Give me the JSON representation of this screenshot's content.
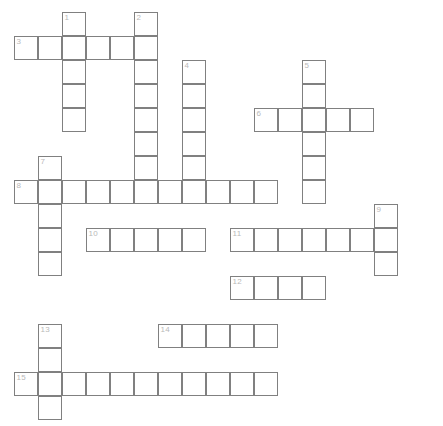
{
  "puzzle": {
    "title": "",
    "type": "crossword-grid",
    "cell_size": 24,
    "origin_x": 14,
    "origin_y": 12,
    "grid_color": "#808080",
    "cell_fill": "#ffffff",
    "number_color": "#b9b9b9",
    "background": "#ffffff",
    "cols": 17,
    "rows": 17,
    "entries": [
      {
        "number": "1",
        "direction": "down",
        "col": 2,
        "row": 0,
        "length": 5
      },
      {
        "number": "2",
        "direction": "down",
        "col": 5,
        "row": 0,
        "length": 8
      },
      {
        "number": "3",
        "direction": "across",
        "col": 0,
        "row": 1,
        "length": 6
      },
      {
        "number": "4",
        "direction": "down",
        "col": 7,
        "row": 2,
        "length": 6
      },
      {
        "number": "5",
        "direction": "down",
        "col": 12,
        "row": 2,
        "length": 6
      },
      {
        "number": "6",
        "direction": "across",
        "col": 10,
        "row": 4,
        "length": 5
      },
      {
        "number": "7",
        "direction": "down",
        "col": 1,
        "row": 6,
        "length": 5
      },
      {
        "number": "8",
        "direction": "across",
        "col": 0,
        "row": 7,
        "length": 11
      },
      {
        "number": "9",
        "direction": "down",
        "col": 15,
        "row": 8,
        "length": 3
      },
      {
        "number": "10",
        "direction": "across",
        "col": 3,
        "row": 9,
        "length": 5
      },
      {
        "number": "11",
        "direction": "across",
        "col": 9,
        "row": 9,
        "length": 7
      },
      {
        "number": "12",
        "direction": "across",
        "col": 9,
        "row": 11,
        "length": 4
      },
      {
        "number": "13",
        "direction": "down",
        "col": 1,
        "row": 13,
        "length": 4
      },
      {
        "number": "14",
        "direction": "across",
        "col": 6,
        "row": 13,
        "length": 5
      },
      {
        "number": "15",
        "direction": "across",
        "col": 0,
        "row": 15,
        "length": 11
      }
    ],
    "numbered_cells": [
      {
        "number": "1",
        "col": 2,
        "row": 0
      },
      {
        "number": "2",
        "col": 5,
        "row": 0
      },
      {
        "number": "3",
        "col": 0,
        "row": 1
      },
      {
        "number": "4",
        "col": 7,
        "row": 2
      },
      {
        "number": "5",
        "col": 12,
        "row": 2
      },
      {
        "number": "6",
        "col": 10,
        "row": 4
      },
      {
        "number": "7",
        "col": 1,
        "row": 6
      },
      {
        "number": "8",
        "col": 0,
        "row": 7
      },
      {
        "number": "9",
        "col": 15,
        "row": 8
      },
      {
        "number": "10",
        "col": 3,
        "row": 9
      },
      {
        "number": "11",
        "col": 9,
        "row": 9
      },
      {
        "number": "12",
        "col": 9,
        "row": 11
      },
      {
        "number": "13",
        "col": 1,
        "row": 13
      },
      {
        "number": "14",
        "col": 6,
        "row": 13
      },
      {
        "number": "15",
        "col": 0,
        "row": 15
      }
    ]
  }
}
